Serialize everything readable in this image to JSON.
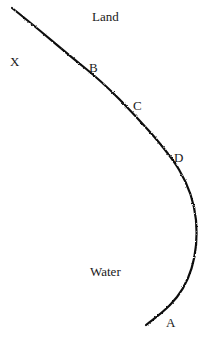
{
  "diagram": {
    "regions": {
      "land": "Land",
      "water": "Water"
    },
    "points": {
      "x": "X",
      "a": "A",
      "b": "B",
      "c": "C",
      "d": "D"
    },
    "shoreline": {
      "color": "#111111",
      "path": "M12,8 C 40,30 60,48 85,68 C 110,88 130,110 150,132 C 170,155 192,180 196,220 C 199,255 190,285 170,305 C 160,315 152,320 146,325"
    }
  }
}
